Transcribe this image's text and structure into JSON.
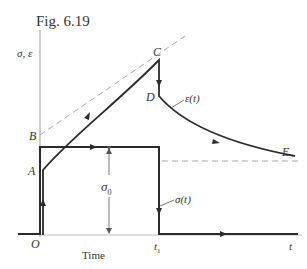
{
  "figure": {
    "title": "Fig. 6.19",
    "y_axis_label": "σ, ε",
    "x_axis_label": "Time",
    "x_axis_end_label": "t",
    "t1_label": "t",
    "t1_sub": "1",
    "origin_label": "O",
    "stress_amplitude_label": "σ",
    "stress_amplitude_sub": "0",
    "stress_curve_label": "σ(t)",
    "strain_curve_label": "ε(t)",
    "points": {
      "A": "A",
      "B": "B",
      "C": "C",
      "D": "D",
      "E": "E"
    },
    "colors": {
      "curve": "#2b2b2b",
      "axis": "#999999",
      "dashed": "#aaaaaa",
      "text": "#333333"
    }
  }
}
